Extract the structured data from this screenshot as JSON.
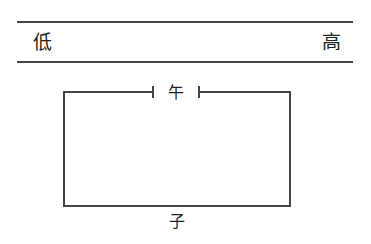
{
  "scale": {
    "low_label": "低",
    "high_label": "高"
  },
  "circuit": {
    "top_label": "午",
    "bottom_label": "子"
  },
  "colors": {
    "line": "#444444",
    "text": "#222222"
  }
}
